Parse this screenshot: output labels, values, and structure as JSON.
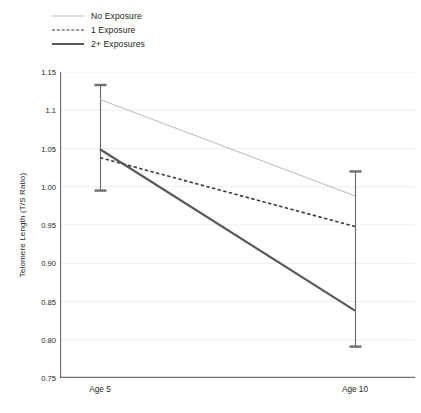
{
  "chart_data": {
    "type": "line",
    "title": "",
    "xlabel": "",
    "ylabel": "Telomere Length (T/S Ratio)",
    "categories": [
      "Age 5",
      "Age 10"
    ],
    "x": [
      0,
      1
    ],
    "ylim": [
      0.75,
      1.15
    ],
    "yticks": [
      1.15,
      1.1,
      1.05,
      1.0,
      0.95,
      0.9,
      0.85,
      0.8,
      0.75
    ],
    "ytick_labels": [
      "1.15",
      "1.1",
      "1.05",
      "1.00",
      "0.95",
      "0.90",
      "0.85",
      "0.80",
      "0.75"
    ],
    "grid": true,
    "legend_position": "top-left",
    "series": [
      {
        "name": "No Exposure",
        "values": [
          1.114,
          0.988
        ],
        "style": "solid-thin",
        "color": "#b9b9b9",
        "width": 1
      },
      {
        "name": "1 Exposure",
        "values": [
          1.038,
          0.948
        ],
        "style": "dashed",
        "color": "#3a3a3a",
        "width": 1.6
      },
      {
        "name": "2+ Exposures",
        "values": [
          1.049,
          0.838
        ],
        "style": "solid-thick",
        "color": "#58595b",
        "width": 2.2
      }
    ],
    "error_bars": [
      {
        "category": "Age 5",
        "attached_to": "2+ Exposures",
        "center": 1.049,
        "low": 0.995,
        "high": 1.133
      },
      {
        "category": "Age 10",
        "attached_to": "2+ Exposures",
        "center": 0.838,
        "low": 0.791,
        "high": 1.02
      }
    ]
  },
  "legend": {
    "items": [
      {
        "label": "No Exposure"
      },
      {
        "label": "1 Exposure"
      },
      {
        "label": "2+ Exposures"
      }
    ]
  },
  "colors": {
    "axis": "#6e6f71",
    "grid": "#ededed",
    "text": "#231f20",
    "series_no_exposure": "#b9b9b9",
    "series_one_exposure": "#3a3a3a",
    "series_two_exposures": "#58595b",
    "error_bar": "#6e6f71",
    "background": "#ffffff"
  }
}
